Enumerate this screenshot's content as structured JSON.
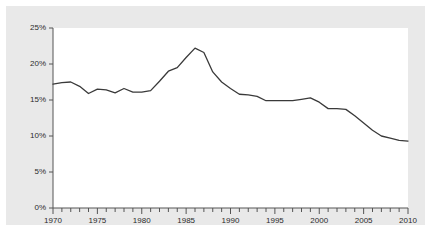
{
  "chart_data": {
    "type": "line",
    "title": "",
    "subtitle": "",
    "xlabel": "",
    "ylabel": "",
    "xlim": [
      1970,
      2010
    ],
    "ylim": [
      0,
      25
    ],
    "grid": false,
    "legend": null,
    "y_tick_labels": [
      "0%",
      "5%",
      "10%",
      "15%",
      "20%",
      "25%"
    ],
    "y_tick_values": [
      0,
      5,
      10,
      15,
      20,
      25
    ],
    "x_tick_labels": [
      "1970",
      "1975",
      "1980",
      "1985",
      "1990",
      "1995",
      "2000",
      "2005",
      "2010"
    ],
    "x_major_tick_values": [
      1970,
      1975,
      1980,
      1985,
      1990,
      1995,
      2000,
      2005,
      2010
    ],
    "x_minor_tick_step": 1,
    "x": [
      1970,
      1971,
      1972,
      1973,
      1974,
      1975,
      1976,
      1977,
      1978,
      1979,
      1980,
      1981,
      1982,
      1983,
      1984,
      1985,
      1986,
      1987,
      1988,
      1989,
      1990,
      1991,
      1992,
      1993,
      1994,
      1995,
      1996,
      1997,
      1998,
      1999,
      2000,
      2001,
      2002,
      2003,
      2004,
      2005,
      2006,
      2007,
      2008,
      2009,
      2010
    ],
    "values": [
      17.2,
      17.4,
      17.5,
      16.9,
      15.9,
      16.5,
      16.4,
      16.0,
      16.6,
      16.1,
      16.1,
      16.3,
      17.6,
      19.0,
      19.5,
      20.9,
      22.2,
      21.6,
      18.9,
      17.5,
      16.6,
      15.8,
      15.7,
      15.5,
      14.9,
      14.9,
      14.9,
      14.9,
      15.1,
      15.3,
      14.7,
      13.8,
      13.8,
      13.7,
      12.8,
      11.8,
      10.8,
      10.0,
      9.7,
      9.4,
      9.3
    ],
    "series": [
      {
        "name": "series-1",
        "color": "#3a3a3a",
        "values": [
          17.2,
          17.4,
          17.5,
          16.9,
          15.9,
          16.5,
          16.4,
          16.0,
          16.6,
          16.1,
          16.1,
          16.3,
          17.6,
          19.0,
          19.5,
          20.9,
          22.2,
          21.6,
          18.9,
          17.5,
          16.6,
          15.8,
          15.7,
          15.5,
          14.9,
          14.9,
          14.9,
          14.9,
          15.1,
          15.3,
          14.7,
          13.8,
          13.8,
          13.7,
          12.8,
          11.8,
          10.8,
          10.0,
          9.7,
          9.4,
          9.3
        ]
      }
    ],
    "colors": {
      "line": "#3a3a3a",
      "axis": "#555555",
      "plot_background": "#ffffff",
      "mat_background": "#e9e9e9",
      "tick_label": "#2b2b2b"
    }
  }
}
